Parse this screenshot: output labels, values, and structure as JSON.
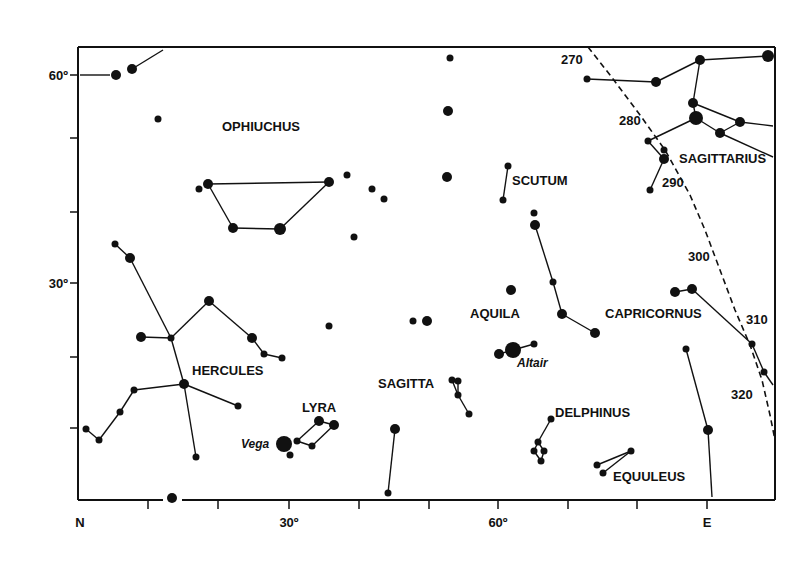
{
  "chart_data": {
    "type": "star-chart",
    "title": "",
    "frame": {
      "x0": 78,
      "y0": 47,
      "x1": 775,
      "y1": 500
    },
    "y_axis": {
      "ticks": [
        {
          "y": 75,
          "label": "60º"
        },
        {
          "y": 138,
          "label": ""
        },
        {
          "y": 212,
          "label": ""
        },
        {
          "y": 283,
          "label": "30º"
        },
        {
          "y": 357,
          "label": ""
        },
        {
          "y": 428,
          "label": ""
        }
      ]
    },
    "x_axis": {
      "ticks": [
        {
          "x": 148,
          "label": ""
        },
        {
          "x": 218,
          "label": ""
        },
        {
          "x": 289,
          "label": "30º"
        },
        {
          "x": 359,
          "label": ""
        },
        {
          "x": 429,
          "label": ""
        },
        {
          "x": 498,
          "label": "60º"
        },
        {
          "x": 568,
          "label": ""
        },
        {
          "x": 637,
          "label": ""
        },
        {
          "x": 707,
          "label": "E"
        }
      ],
      "origin_label": "N"
    },
    "constellations": [
      {
        "name": "OPHIUCHUS",
        "x": 222,
        "y": 131
      },
      {
        "name": "SCUTUM",
        "x": 512,
        "y": 185
      },
      {
        "name": "SAGITTARIUS",
        "x": 679,
        "y": 163
      },
      {
        "name": "AQUILA",
        "x": 470,
        "y": 318
      },
      {
        "name": "CAPRICORNUS",
        "x": 605,
        "y": 318
      },
      {
        "name": "HERCULES",
        "x": 192,
        "y": 375
      },
      {
        "name": "SAGITTA",
        "x": 378,
        "y": 388
      },
      {
        "name": "LYRA",
        "x": 302,
        "y": 412
      },
      {
        "name": "DELPHINUS",
        "x": 555,
        "y": 417
      },
      {
        "name": "EQUULEUS",
        "x": 613,
        "y": 481
      }
    ],
    "named_stars": [
      {
        "name": "Altair",
        "x": 517,
        "y": 367
      },
      {
        "name": "Vega",
        "x": 241,
        "y": 448
      }
    ],
    "ecliptic": {
      "path": [
        [
          588,
          47
        ],
        [
          610,
          75
        ],
        [
          640,
          115
        ],
        [
          665,
          150
        ],
        [
          690,
          195
        ],
        [
          705,
          230
        ],
        [
          720,
          270
        ],
        [
          735,
          310
        ],
        [
          750,
          345
        ],
        [
          762,
          380
        ],
        [
          770,
          415
        ],
        [
          775,
          440
        ]
      ],
      "labels": [
        {
          "text": "270",
          "x": 561,
          "y": 64
        },
        {
          "text": "280",
          "x": 619,
          "y": 125
        },
        {
          "text": "290",
          "x": 662,
          "y": 187
        },
        {
          "text": "300",
          "x": 688,
          "y": 261
        },
        {
          "text": "310",
          "x": 746,
          "y": 324
        },
        {
          "text": "320",
          "x": 731,
          "y": 399
        }
      ]
    },
    "stars": [
      {
        "x": 116,
        "y": 75,
        "r": 5
      },
      {
        "x": 132,
        "y": 69,
        "r": 5
      },
      {
        "x": 158,
        "y": 119,
        "r": 3.5
      },
      {
        "x": 199,
        "y": 189,
        "r": 3.5
      },
      {
        "x": 208,
        "y": 184,
        "r": 5
      },
      {
        "x": 233,
        "y": 228,
        "r": 5
      },
      {
        "x": 280,
        "y": 229,
        "r": 6
      },
      {
        "x": 329,
        "y": 182,
        "r": 5
      },
      {
        "x": 347,
        "y": 175,
        "r": 3.5
      },
      {
        "x": 372,
        "y": 189,
        "r": 3.5
      },
      {
        "x": 384,
        "y": 199,
        "r": 3.5
      },
      {
        "x": 354,
        "y": 237,
        "r": 3.5
      },
      {
        "x": 450,
        "y": 58,
        "r": 3.5
      },
      {
        "x": 448,
        "y": 111,
        "r": 5
      },
      {
        "x": 447,
        "y": 177,
        "r": 5
      },
      {
        "x": 508,
        "y": 166,
        "r": 3.5
      },
      {
        "x": 503,
        "y": 200,
        "r": 3.5
      },
      {
        "x": 534,
        "y": 213,
        "r": 3.5
      },
      {
        "x": 535,
        "y": 225,
        "r": 5
      },
      {
        "x": 553,
        "y": 282,
        "r": 3.5
      },
      {
        "x": 562,
        "y": 314,
        "r": 5
      },
      {
        "x": 595,
        "y": 333,
        "r": 5
      },
      {
        "x": 511,
        "y": 290,
        "r": 5
      },
      {
        "x": 413,
        "y": 321,
        "r": 3.5
      },
      {
        "x": 427,
        "y": 321,
        "r": 5
      },
      {
        "x": 329,
        "y": 326,
        "r": 3.5
      },
      {
        "x": 499,
        "y": 354,
        "r": 5
      },
      {
        "x": 513,
        "y": 350,
        "r": 8
      },
      {
        "x": 534,
        "y": 344,
        "r": 3.5
      },
      {
        "x": 587,
        "y": 79,
        "r": 3.5
      },
      {
        "x": 656,
        "y": 82,
        "r": 5
      },
      {
        "x": 700,
        "y": 60,
        "r": 5
      },
      {
        "x": 768,
        "y": 56,
        "r": 6
      },
      {
        "x": 693,
        "y": 103,
        "r": 5
      },
      {
        "x": 696,
        "y": 118,
        "r": 7
      },
      {
        "x": 740,
        "y": 122,
        "r": 5
      },
      {
        "x": 720,
        "y": 133,
        "r": 5
      },
      {
        "x": 648,
        "y": 141,
        "r": 3.5
      },
      {
        "x": 664,
        "y": 150,
        "r": 3.5
      },
      {
        "x": 664,
        "y": 159,
        "r": 5
      },
      {
        "x": 650,
        "y": 190,
        "r": 3.5
      },
      {
        "x": 675,
        "y": 292,
        "r": 5
      },
      {
        "x": 692,
        "y": 289,
        "r": 5
      },
      {
        "x": 752,
        "y": 344,
        "r": 3.5
      },
      {
        "x": 764,
        "y": 372,
        "r": 3.5
      },
      {
        "x": 686,
        "y": 349,
        "r": 3.5
      },
      {
        "x": 708,
        "y": 430,
        "r": 5
      },
      {
        "x": 115,
        "y": 244,
        "r": 3.5
      },
      {
        "x": 130,
        "y": 258,
        "r": 5
      },
      {
        "x": 209,
        "y": 301,
        "r": 5
      },
      {
        "x": 141,
        "y": 337,
        "r": 5
      },
      {
        "x": 171,
        "y": 338,
        "r": 3.5
      },
      {
        "x": 252,
        "y": 338,
        "r": 5
      },
      {
        "x": 264,
        "y": 354,
        "r": 3.5
      },
      {
        "x": 282,
        "y": 358,
        "r": 3.5
      },
      {
        "x": 184,
        "y": 384,
        "r": 5
      },
      {
        "x": 134,
        "y": 390,
        "r": 3.5
      },
      {
        "x": 120,
        "y": 412,
        "r": 3.5
      },
      {
        "x": 86,
        "y": 429,
        "r": 3.5
      },
      {
        "x": 99,
        "y": 440,
        "r": 3.5
      },
      {
        "x": 238,
        "y": 406,
        "r": 3.5
      },
      {
        "x": 196,
        "y": 457,
        "r": 3.5
      },
      {
        "x": 172,
        "y": 498,
        "r": 5
      },
      {
        "x": 284,
        "y": 444,
        "r": 8
      },
      {
        "x": 290,
        "y": 455,
        "r": 3.5
      },
      {
        "x": 297,
        "y": 441,
        "r": 3.5
      },
      {
        "x": 312,
        "y": 446,
        "r": 3.5
      },
      {
        "x": 319,
        "y": 421,
        "r": 5
      },
      {
        "x": 334,
        "y": 425,
        "r": 5
      },
      {
        "x": 395,
        "y": 429,
        "r": 5
      },
      {
        "x": 388,
        "y": 493,
        "r": 3.5
      },
      {
        "x": 452,
        "y": 380,
        "r": 3.5
      },
      {
        "x": 458,
        "y": 381,
        "r": 3.5
      },
      {
        "x": 458,
        "y": 395,
        "r": 3.5
      },
      {
        "x": 469,
        "y": 414,
        "r": 3.5
      },
      {
        "x": 551,
        "y": 419,
        "r": 3.5
      },
      {
        "x": 538,
        "y": 442,
        "r": 3.5
      },
      {
        "x": 534,
        "y": 451,
        "r": 3.5
      },
      {
        "x": 544,
        "y": 451,
        "r": 3.5
      },
      {
        "x": 541,
        "y": 461,
        "r": 3.5
      },
      {
        "x": 597,
        "y": 465,
        "r": 3.5
      },
      {
        "x": 603,
        "y": 473,
        "r": 3.5
      },
      {
        "x": 631,
        "y": 451,
        "r": 3.5
      }
    ],
    "lines": [
      [
        [
          80,
          75
        ],
        [
          110,
          75
        ]
      ],
      [
        [
          132,
          69
        ],
        [
          163,
          50
        ]
      ],
      [
        [
          208,
          184
        ],
        [
          329,
          182
        ]
      ],
      [
        [
          208,
          184
        ],
        [
          233,
          228
        ]
      ],
      [
        [
          233,
          228
        ],
        [
          280,
          229
        ]
      ],
      [
        [
          280,
          229
        ],
        [
          329,
          182
        ]
      ],
      [
        [
          508,
          166
        ],
        [
          503,
          200
        ]
      ],
      [
        [
          535,
          225
        ],
        [
          553,
          282
        ]
      ],
      [
        [
          553,
          282
        ],
        [
          562,
          314
        ]
      ],
      [
        [
          562,
          314
        ],
        [
          595,
          333
        ]
      ],
      [
        [
          499,
          354
        ],
        [
          513,
          350
        ]
      ],
      [
        [
          513,
          350
        ],
        [
          534,
          344
        ]
      ],
      [
        [
          587,
          79
        ],
        [
          656,
          82
        ]
      ],
      [
        [
          656,
          82
        ],
        [
          700,
          60
        ]
      ],
      [
        [
          700,
          60
        ],
        [
          768,
          56
        ]
      ],
      [
        [
          700,
          60
        ],
        [
          693,
          103
        ]
      ],
      [
        [
          693,
          103
        ],
        [
          696,
          118
        ]
      ],
      [
        [
          696,
          118
        ],
        [
          648,
          141
        ]
      ],
      [
        [
          696,
          118
        ],
        [
          720,
          133
        ]
      ],
      [
        [
          720,
          133
        ],
        [
          740,
          122
        ]
      ],
      [
        [
          740,
          122
        ],
        [
          773,
          126
        ]
      ],
      [
        [
          693,
          103
        ],
        [
          740,
          122
        ]
      ],
      [
        [
          720,
          133
        ],
        [
          773,
          157
        ]
      ],
      [
        [
          648,
          141
        ],
        [
          664,
          159
        ]
      ],
      [
        [
          664,
          159
        ],
        [
          650,
          190
        ]
      ],
      [
        [
          675,
          292
        ],
        [
          692,
          289
        ]
      ],
      [
        [
          692,
          289
        ],
        [
          752,
          344
        ]
      ],
      [
        [
          752,
          344
        ],
        [
          764,
          372
        ]
      ],
      [
        [
          764,
          372
        ],
        [
          773,
          385
        ]
      ],
      [
        [
          686,
          349
        ],
        [
          708,
          430
        ]
      ],
      [
        [
          708,
          430
        ],
        [
          712,
          497
        ]
      ],
      [
        [
          115,
          244
        ],
        [
          130,
          258
        ]
      ],
      [
        [
          130,
          258
        ],
        [
          171,
          338
        ]
      ],
      [
        [
          141,
          337
        ],
        [
          171,
          338
        ]
      ],
      [
        [
          171,
          338
        ],
        [
          209,
          301
        ]
      ],
      [
        [
          209,
          301
        ],
        [
          252,
          338
        ]
      ],
      [
        [
          252,
          338
        ],
        [
          264,
          354
        ]
      ],
      [
        [
          264,
          354
        ],
        [
          282,
          358
        ]
      ],
      [
        [
          171,
          338
        ],
        [
          184,
          384
        ]
      ],
      [
        [
          184,
          384
        ],
        [
          134,
          390
        ]
      ],
      [
        [
          134,
          390
        ],
        [
          120,
          412
        ]
      ],
      [
        [
          120,
          412
        ],
        [
          99,
          440
        ]
      ],
      [
        [
          99,
          440
        ],
        [
          86,
          429
        ]
      ],
      [
        [
          184,
          384
        ],
        [
          238,
          406
        ]
      ],
      [
        [
          184,
          384
        ],
        [
          196,
          457
        ]
      ],
      [
        [
          297,
          441
        ],
        [
          319,
          421
        ]
      ],
      [
        [
          319,
          421
        ],
        [
          334,
          425
        ]
      ],
      [
        [
          334,
          425
        ],
        [
          312,
          446
        ]
      ],
      [
        [
          312,
          446
        ],
        [
          297,
          441
        ]
      ],
      [
        [
          395,
          429
        ],
        [
          388,
          493
        ]
      ],
      [
        [
          452,
          380
        ],
        [
          458,
          395
        ]
      ],
      [
        [
          458,
          381
        ],
        [
          458,
          395
        ]
      ],
      [
        [
          458,
          395
        ],
        [
          469,
          414
        ]
      ],
      [
        [
          551,
          419
        ],
        [
          538,
          442
        ]
      ],
      [
        [
          538,
          442
        ],
        [
          534,
          451
        ]
      ],
      [
        [
          538,
          442
        ],
        [
          544,
          451
        ]
      ],
      [
        [
          534,
          451
        ],
        [
          541,
          461
        ]
      ],
      [
        [
          544,
          451
        ],
        [
          541,
          461
        ]
      ],
      [
        [
          597,
          465
        ],
        [
          631,
          451
        ]
      ],
      [
        [
          603,
          473
        ],
        [
          631,
          451
        ]
      ]
    ]
  }
}
